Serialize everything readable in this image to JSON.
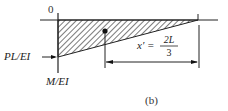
{
  "diagram": {
    "origin_label": "0",
    "left_value_label": "PL/EI",
    "axis_label": "M/EI",
    "distance_label_lhs": "x′ =",
    "distance_numerator": "2L",
    "distance_denominator": "3",
    "caption": "(b)",
    "colors": {
      "line": "#222222",
      "hatch": "#333333",
      "background": "#ffffff"
    }
  }
}
